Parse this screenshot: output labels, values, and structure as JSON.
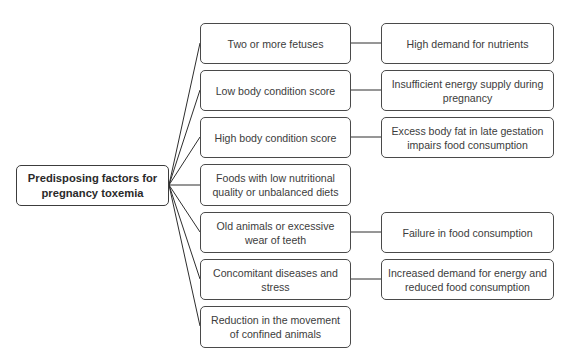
{
  "diagram": {
    "hub": {
      "label": "Predisposing factors for pregnancy toxemia",
      "line1": "Predisposing factors for",
      "line2": "pregnancy toxemia"
    },
    "factors": [
      {
        "label": "Two or more fetuses",
        "effect": "High demand for nutrients"
      },
      {
        "label": "Low body condition score",
        "effect": "Insufficient energy supply during pregnancy"
      },
      {
        "label": "High body condition score",
        "effect": "Excess body fat in late gestation impairs food consumption"
      },
      {
        "label": "Foods with low nutritional quality or unbalanced diets",
        "effect": null
      },
      {
        "label": "Old animals or excessive wear of teeth",
        "effect": "Failure in food consumption"
      },
      {
        "label": "Concomitant diseases and stress",
        "effect": "Increased demand for energy and reduced food consumption"
      },
      {
        "label": "Reduction in the movement of confined animals",
        "effect": null
      }
    ],
    "colors": {
      "border": "#4a4a4a",
      "line": "#2e2e2e",
      "text": "#3c3c3c",
      "background": "#ffffff"
    }
  }
}
